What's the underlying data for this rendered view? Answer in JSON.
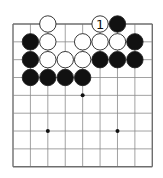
{
  "diagram": {
    "type": "go-board-fragment",
    "columns": 9,
    "rows": 9,
    "colors": {
      "line": "#8a8a8a",
      "border": "#6e6e6e",
      "black": "#111111",
      "white": "#ffffff",
      "stone_outline": "#222222",
      "star": "#111111",
      "background": "#ffffff"
    },
    "star_points": [
      {
        "col": 4,
        "row": 4
      },
      {
        "col": 2,
        "row": 6
      },
      {
        "col": 6,
        "row": 6
      }
    ],
    "stones": [
      {
        "col": 2,
        "row": 0,
        "color": "white",
        "label": ""
      },
      {
        "col": 5,
        "row": 0,
        "color": "white",
        "label": "1"
      },
      {
        "col": 6,
        "row": 0,
        "color": "black",
        "label": ""
      },
      {
        "col": 1,
        "row": 1,
        "color": "black",
        "label": ""
      },
      {
        "col": 2,
        "row": 1,
        "color": "white",
        "label": ""
      },
      {
        "col": 4,
        "row": 1,
        "color": "white",
        "label": ""
      },
      {
        "col": 5,
        "row": 1,
        "color": "white",
        "label": ""
      },
      {
        "col": 6,
        "row": 1,
        "color": "white",
        "label": ""
      },
      {
        "col": 7,
        "row": 1,
        "color": "black",
        "label": ""
      },
      {
        "col": 1,
        "row": 2,
        "color": "black",
        "label": ""
      },
      {
        "col": 2,
        "row": 2,
        "color": "white",
        "label": ""
      },
      {
        "col": 3,
        "row": 2,
        "color": "white",
        "label": ""
      },
      {
        "col": 4,
        "row": 2,
        "color": "white",
        "label": ""
      },
      {
        "col": 5,
        "row": 2,
        "color": "black",
        "label": ""
      },
      {
        "col": 6,
        "row": 2,
        "color": "black",
        "label": ""
      },
      {
        "col": 7,
        "row": 2,
        "color": "black",
        "label": ""
      },
      {
        "col": 1,
        "row": 3,
        "color": "black",
        "label": ""
      },
      {
        "col": 2,
        "row": 3,
        "color": "black",
        "label": ""
      },
      {
        "col": 3,
        "row": 3,
        "color": "black",
        "label": ""
      },
      {
        "col": 4,
        "row": 3,
        "color": "black",
        "label": ""
      }
    ]
  }
}
